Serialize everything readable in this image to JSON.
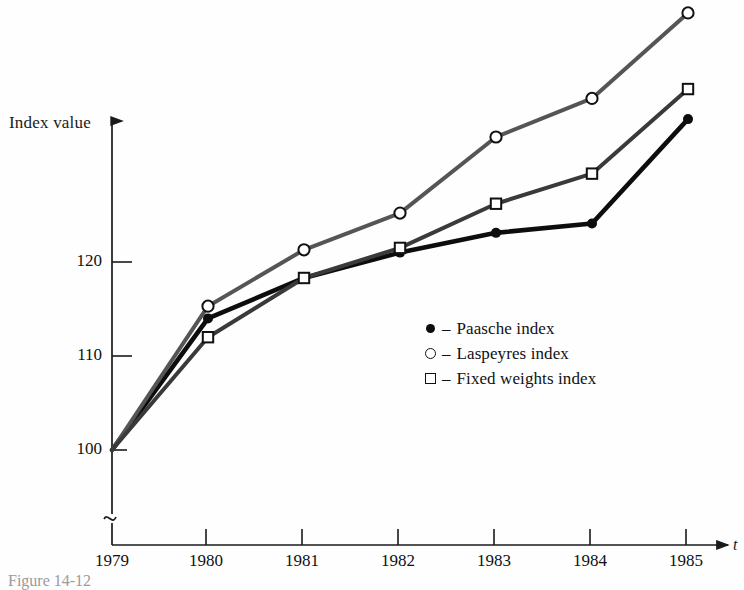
{
  "chart_data": {
    "type": "line",
    "title": "",
    "xlabel": "t",
    "ylabel": "Index value",
    "categories": [
      "1979",
      "1980",
      "1981",
      "1982",
      "1983",
      "1984",
      "1985"
    ],
    "x": [
      1979,
      1980,
      1981,
      1982,
      1983,
      1984,
      1985
    ],
    "xlim": [
      1979,
      1985
    ],
    "ylim": [
      100,
      148
    ],
    "y_ticks": [
      100,
      110,
      120
    ],
    "y_tick_labels": [
      "100",
      "110",
      "120"
    ],
    "grid": false,
    "axis_break": true,
    "legend_position": "center",
    "series": [
      {
        "name": "Paasche index",
        "marker": "filled-circle",
        "color": "#0d0d0d",
        "values": [
          100.0,
          114.0,
          118.3,
          121.0,
          123.1,
          124.1,
          135.2
        ]
      },
      {
        "name": "Laspeyres index",
        "marker": "open-circle",
        "color": "#555555",
        "values": [
          100.0,
          115.3,
          121.3,
          125.2,
          133.3,
          137.4,
          146.5
        ]
      },
      {
        "name": "Fixed weights index",
        "marker": "open-square",
        "color": "#3a3a3a",
        "values": [
          100.0,
          112.0,
          118.3,
          121.5,
          126.2,
          129.4,
          138.4
        ]
      }
    ]
  },
  "axes": {
    "y_title": "Index value",
    "x_title": "t",
    "y_tick_labels": [
      "120",
      "110",
      "100"
    ],
    "x_tick_labels": [
      "1979",
      "1980",
      "1981",
      "1982",
      "1983",
      "1984",
      "1985"
    ]
  },
  "legend": {
    "separator": "–",
    "items": [
      {
        "marker": "filled-circle-icon",
        "label": "Paasche index"
      },
      {
        "marker": "open-circle-icon",
        "label": "Laspeyres index"
      },
      {
        "marker": "open-square-icon",
        "label": "Fixed weights index"
      }
    ]
  },
  "caption": {
    "text": "Figure  14-12"
  },
  "colors": {
    "paasche": "#0d0d0d",
    "laspeyres": "#555555",
    "fixed_weights": "#3a3a3a",
    "axis": "#1a1a1a",
    "background": "#fefefe"
  }
}
